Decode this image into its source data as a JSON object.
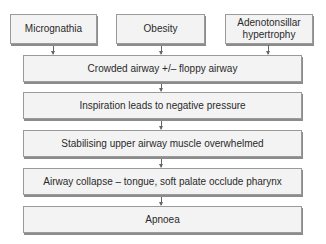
{
  "diagram": {
    "causes": [
      {
        "label": "Micrognathia"
      },
      {
        "label": "Obesity"
      },
      {
        "label": "Adenotonsillar hypertrophy"
      }
    ],
    "steps": [
      {
        "label": "Crowded airway +/– floppy airway"
      },
      {
        "label": "Inspiration leads to negative pressure"
      },
      {
        "label": "Stabilising upper airway muscle overwhelmed"
      },
      {
        "label": "Airway collapse – tongue, soft palate occlude pharynx"
      },
      {
        "label": "Apnoea"
      }
    ]
  }
}
